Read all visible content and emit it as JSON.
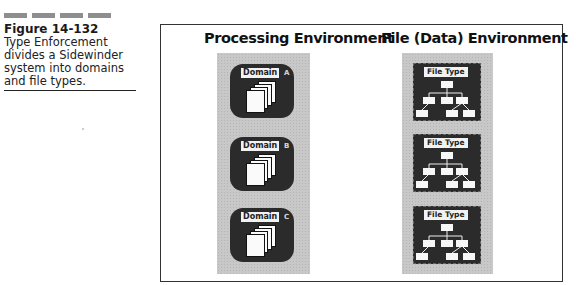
{
  "caption": {
    "dash_count": 4,
    "figure_number": "Figure 14-132",
    "text": "Type Enforcement divides a Sidewinder system into domains and file types."
  },
  "diagram": {
    "left_title": "Processing Environment",
    "right_title": "File (Data) Environment",
    "domains": [
      {
        "label": "Domain",
        "suffix": "A",
        "icon": "stacked-pages-icon"
      },
      {
        "label": "Domain",
        "suffix": "B",
        "icon": "stacked-pages-icon"
      },
      {
        "label": "Domain",
        "suffix": "C",
        "icon": "stacked-pages-icon"
      }
    ],
    "file_types": [
      {
        "label": "File Type",
        "icon": "hierarchy-tree-icon"
      },
      {
        "label": "File Type",
        "icon": "hierarchy-tree-icon"
      },
      {
        "label": "File Type",
        "icon": "hierarchy-tree-icon"
      }
    ],
    "colors": {
      "tile": "#2b2b2b",
      "panel": "#c8c8c8",
      "label_bg": "#f2f2f2",
      "frame": "#333333"
    }
  }
}
